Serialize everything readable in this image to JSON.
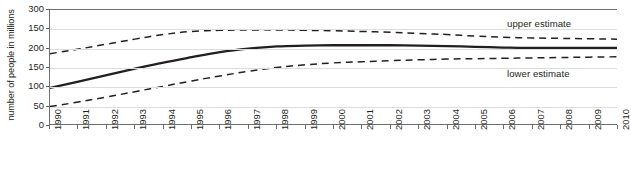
{
  "chart_data": {
    "type": "line",
    "title": "",
    "xlabel": "",
    "ylabel": "number of people in millions",
    "ylim": [
      0,
      300
    ],
    "xlim": [
      1990,
      2010
    ],
    "grid": true,
    "legend_position": "inline-right",
    "ytick_labels": [
      "300",
      "150",
      "200",
      "150",
      "100",
      "50",
      "0"
    ],
    "ytick_values": [
      300,
      250,
      200,
      150,
      100,
      50,
      0
    ],
    "x": [
      1990,
      1991,
      1992,
      1993,
      1994,
      1995,
      1996,
      1997,
      1998,
      1999,
      2000,
      2001,
      2002,
      2003,
      2004,
      2005,
      2006,
      2007,
      2008,
      2009,
      2010
    ],
    "xtick_labels": [
      "1990",
      "1991",
      "1992",
      "1993",
      "1994",
      "1995",
      "1996",
      "1997",
      "1998",
      "1999",
      "2000",
      "2001",
      "2002",
      "2003",
      "2004",
      "2005",
      "2006",
      "2007",
      "2008",
      "2009",
      "2010"
    ],
    "series": [
      {
        "name": "upper estimate",
        "style": "dashed",
        "label": "upper estimate",
        "values": [
          186,
          198,
          211,
          224,
          236,
          244,
          247,
          248,
          248,
          247,
          246,
          244,
          242,
          239,
          236,
          232,
          229,
          227,
          226,
          225,
          224
        ]
      },
      {
        "name": "central estimate",
        "style": "solid",
        "label": "",
        "values": [
          97,
          113,
          130,
          147,
          163,
          177,
          190,
          199,
          205,
          207,
          208,
          208,
          208,
          207,
          206,
          204,
          202,
          201,
          201,
          201,
          201
        ]
      },
      {
        "name": "lower estimate",
        "style": "dashed",
        "label": "lower estimate",
        "values": [
          48,
          60,
          73,
          87,
          101,
          115,
          128,
          140,
          150,
          157,
          162,
          165,
          168,
          170,
          172,
          173,
          174,
          175,
          176,
          177,
          178
        ]
      }
    ]
  },
  "annotations": {
    "upper_label": "upper estimate",
    "lower_label": "lower estimate"
  },
  "axis": {
    "y_title": "number of people in millions"
  },
  "caption": {
    "text": ""
  },
  "colors": {
    "line": "#231f20",
    "grid": "#dcdddf",
    "axis": "#6d6e71",
    "text": "#231f20",
    "background": "#ffffff"
  }
}
